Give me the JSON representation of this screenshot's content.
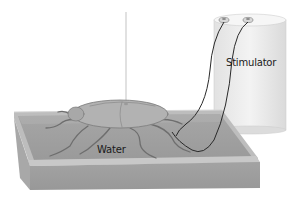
{
  "diagram": {
    "labels": {
      "stimulator": "Stimulator",
      "water": "Water"
    },
    "components": [
      "thread",
      "cockroach",
      "tray",
      "stimulator",
      "electrode-wires"
    ],
    "colors": {
      "background": "#ffffff",
      "tray_rim": "#bdbdbd",
      "tray_side": "#a3a3a3",
      "water": "#9e9e9e",
      "stimulator_body": "#ececec",
      "cockroach_body": "#b0b0b0",
      "wire": "#2a2a2a"
    }
  }
}
